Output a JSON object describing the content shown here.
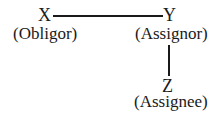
{
  "diagram": {
    "nodes": [
      {
        "id": "X",
        "label": "X",
        "role": "(Obligor)"
      },
      {
        "id": "Y",
        "label": "Y",
        "role": "(Assignor)"
      },
      {
        "id": "Z",
        "label": "Z",
        "role": "(Assignee)"
      }
    ],
    "edges": [
      {
        "from": "X",
        "to": "Y",
        "orientation": "horizontal"
      },
      {
        "from": "Y",
        "to": "Z",
        "orientation": "vertical"
      }
    ],
    "line_color": "#1a1a1a"
  }
}
